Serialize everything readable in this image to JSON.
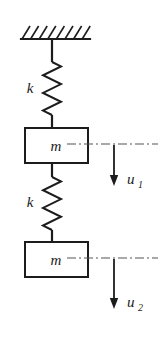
{
  "figure": {
    "background_color": "#ffffff",
    "ink_color": "#1c1c1c",
    "dashdot_color": "#555555"
  },
  "support": {
    "name": "fixed-support-ceiling",
    "line": {
      "x1": 21,
      "y1": 39,
      "x2": 90,
      "y2": 39
    },
    "hatch_count": 8,
    "hatch_dx": 8,
    "hatch_dy": 13,
    "hatch_spacing": 8.6,
    "hatch_start_x": 22
  },
  "elements": {
    "rod_top": {
      "x": 52,
      "y1": 39,
      "y2": 62
    },
    "rod_mid": {
      "x": 52,
      "y1": 163,
      "y2": 177
    },
    "rod_spring1_bottom": {
      "x": 52,
      "y1": 115,
      "y2": 128
    },
    "rod_spring2_bottom": {
      "x": 52,
      "y1": 230,
      "y2": 242
    }
  },
  "springs": [
    {
      "id": "spring-1",
      "label": "k",
      "label_x": 30,
      "label_y": 93,
      "center_x": 52,
      "top_y": 62,
      "bottom_y": 115,
      "amplitude": 9,
      "coils": 6
    },
    {
      "id": "spring-2",
      "label": "k",
      "label_x": 30,
      "label_y": 207,
      "center_x": 52,
      "top_y": 177,
      "bottom_y": 230,
      "amplitude": 9,
      "coils": 6
    }
  ],
  "masses": [
    {
      "id": "mass-1",
      "label": "m",
      "x": 25,
      "y": 128,
      "width": 63,
      "height": 35,
      "label_x": 56,
      "label_y": 151
    },
    {
      "id": "mass-2",
      "label": "m",
      "x": 25,
      "y": 242,
      "width": 63,
      "height": 35,
      "label_x": 56,
      "label_y": 265
    }
  ],
  "displacements": [
    {
      "id": "displacement-u1",
      "label": "u",
      "subscript": "1",
      "reference_line": {
        "x1": 67,
        "y": 144,
        "x2": 158
      },
      "arrow": {
        "x": 114,
        "y1": 145,
        "y2": 186
      },
      "label_x": 127,
      "label_y": 184,
      "sub_x": 138,
      "sub_y": 188
    },
    {
      "id": "displacement-u2",
      "label": "u",
      "subscript": "2",
      "reference_line": {
        "x1": 67,
        "y": 258,
        "x2": 158
      },
      "arrow": {
        "x": 114,
        "y1": 259,
        "y2": 309
      },
      "label_x": 127,
      "label_y": 307,
      "sub_x": 138,
      "sub_y": 311
    }
  ]
}
